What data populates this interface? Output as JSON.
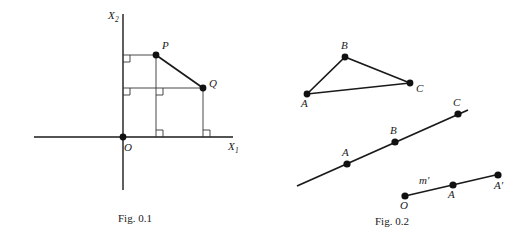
{
  "figures": [
    {
      "id": "fig-0-1",
      "caption": "Fig. 0.1",
      "type": "coordinate-diagram",
      "axes": {
        "x_label": "X",
        "x_sub": "1",
        "y_label": "X",
        "y_sub": "2"
      },
      "points": [
        {
          "name": "O",
          "label": "O",
          "x": 123,
          "y": 137
        },
        {
          "name": "P",
          "label": "P",
          "x": 156,
          "y": 55
        },
        {
          "name": "Q",
          "label": "Q",
          "x": 203,
          "y": 88
        }
      ],
      "right_angle_count": 5
    },
    {
      "id": "fig-0-2",
      "caption": "Fig. 0.2",
      "type": "line-diagram",
      "triangle": {
        "vertices": [
          {
            "name": "A",
            "label": "A",
            "x": 307,
            "y": 94
          },
          {
            "name": "B",
            "label": "B",
            "x": 345,
            "y": 57
          },
          {
            "name": "C",
            "label": "C",
            "x": 410,
            "y": 83
          }
        ]
      },
      "line_m": {
        "start": {
          "x": 297,
          "y": 186
        },
        "end": {
          "x": 468,
          "y": 110
        },
        "points": [
          {
            "name": "A",
            "label": "A",
            "x": 347,
            "y": 167
          },
          {
            "name": "B",
            "label": "B",
            "x": 395,
            "y": 145
          },
          {
            "name": "C",
            "label": "C",
            "x": 458,
            "y": 116
          }
        ]
      },
      "line_m_prime": {
        "label": "m'",
        "start": {
          "x": 405,
          "y": 196
        },
        "end": {
          "x": 498,
          "y": 175
        },
        "points": [
          {
            "name": "O",
            "label": "O",
            "x": 405,
            "y": 196
          },
          {
            "name": "A",
            "label": "A",
            "x": 453,
            "y": 186
          },
          {
            "name": "A-prime",
            "label": "A'",
            "x": 498,
            "y": 175
          }
        ]
      }
    }
  ],
  "colors": {
    "ink": "#1a1a1a",
    "thin_ink": "#333333",
    "background": "#ffffff"
  }
}
